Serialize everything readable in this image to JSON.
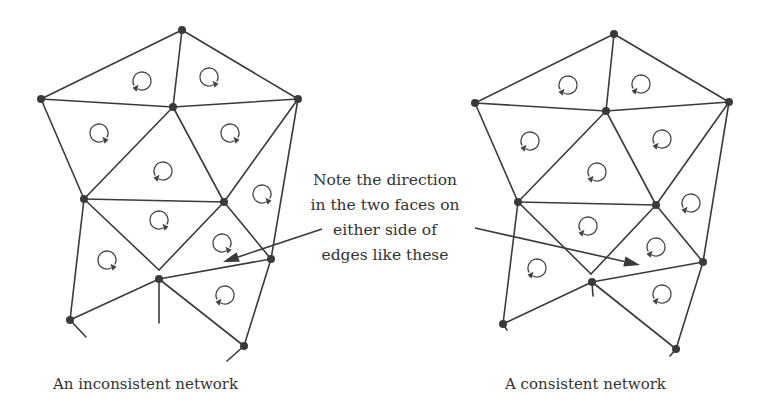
{
  "note": {
    "lines": [
      "Note the direction",
      "in the two faces on",
      "either side of",
      "edges like these"
    ]
  },
  "captions": {
    "left": "An inconsistent network",
    "right": "A consistent network"
  },
  "colors": {
    "ink": "#3a3a3a",
    "text": "#333333",
    "background": "#ffffff"
  },
  "networks": [
    {
      "id": "inconsistent",
      "nodes": [
        [
          182,
          30
        ],
        [
          41,
          99
        ],
        [
          173,
          107
        ],
        [
          298,
          99
        ],
        [
          84,
          199
        ],
        [
          224,
          202
        ],
        [
          271,
          259
        ],
        [
          159,
          279
        ],
        [
          70,
          320
        ],
        [
          244,
          346
        ]
      ],
      "edges": [
        [
          [
            182,
            30
          ],
          [
            41,
            99
          ]
        ],
        [
          [
            182,
            30
          ],
          [
            298,
            99
          ]
        ],
        [
          [
            182,
            30
          ],
          [
            173,
            107
          ]
        ],
        [
          [
            41,
            99
          ],
          [
            173,
            107
          ]
        ],
        [
          [
            173,
            107
          ],
          [
            298,
            99
          ]
        ],
        [
          [
            41,
            99
          ],
          [
            84,
            199
          ]
        ],
        [
          [
            173,
            107
          ],
          [
            84,
            199
          ]
        ],
        [
          [
            173,
            107
          ],
          [
            224,
            202
          ]
        ],
        [
          [
            298,
            99
          ],
          [
            224,
            202
          ]
        ],
        [
          [
            298,
            99
          ],
          [
            271,
            259
          ]
        ],
        [
          [
            84,
            199
          ],
          [
            224,
            202
          ]
        ],
        [
          [
            84,
            199
          ],
          [
            70,
            320
          ]
        ],
        [
          [
            84,
            199
          ],
          [
            159,
            270
          ]
        ],
        [
          [
            224,
            202
          ],
          [
            159,
            270
          ]
        ],
        [
          [
            224,
            202
          ],
          [
            271,
            259
          ]
        ],
        [
          [
            159,
            279
          ],
          [
            271,
            259
          ]
        ],
        [
          [
            70,
            320
          ],
          [
            159,
            279
          ]
        ],
        [
          [
            159,
            279
          ],
          [
            244,
            346
          ]
        ],
        [
          [
            271,
            259
          ],
          [
            244,
            346
          ]
        ],
        [
          [
            159,
            279
          ],
          [
            159,
            323
          ]
        ],
        [
          [
            70,
            320
          ],
          [
            86,
            337
          ]
        ],
        [
          [
            244,
            346
          ],
          [
            227,
            361
          ]
        ]
      ],
      "circulations": [
        {
          "x": 142,
          "y": 81,
          "dir": "cw"
        },
        {
          "x": 209,
          "y": 77,
          "dir": "ccw"
        },
        {
          "x": 99,
          "y": 133,
          "dir": "ccw"
        },
        {
          "x": 230,
          "y": 133,
          "dir": "ccw"
        },
        {
          "x": 163,
          "y": 171,
          "dir": "cw"
        },
        {
          "x": 262,
          "y": 194,
          "dir": "ccw"
        },
        {
          "x": 159,
          "y": 220,
          "dir": "ccw"
        },
        {
          "x": 107,
          "y": 260,
          "dir": "ccw"
        },
        {
          "x": 222,
          "y": 243,
          "dir": "ccw"
        },
        {
          "x": 225,
          "y": 295,
          "dir": "cw"
        }
      ],
      "pointer": {
        "from": [
          322,
          229
        ],
        "to": [
          223,
          262
        ]
      }
    },
    {
      "id": "consistent",
      "nodes": [
        [
          614,
          34
        ],
        [
          475,
          103
        ],
        [
          606,
          111
        ],
        [
          729,
          102
        ],
        [
          518,
          202
        ],
        [
          656,
          205
        ],
        [
          703,
          262
        ],
        [
          592,
          282
        ],
        [
          503,
          324
        ],
        [
          676,
          349
        ]
      ],
      "edges": [
        [
          [
            614,
            34
          ],
          [
            475,
            103
          ]
        ],
        [
          [
            614,
            34
          ],
          [
            729,
            102
          ]
        ],
        [
          [
            614,
            34
          ],
          [
            606,
            111
          ]
        ],
        [
          [
            475,
            103
          ],
          [
            606,
            111
          ]
        ],
        [
          [
            606,
            111
          ],
          [
            729,
            102
          ]
        ],
        [
          [
            475,
            103
          ],
          [
            518,
            202
          ]
        ],
        [
          [
            606,
            111
          ],
          [
            518,
            202
          ]
        ],
        [
          [
            606,
            111
          ],
          [
            656,
            205
          ]
        ],
        [
          [
            729,
            102
          ],
          [
            656,
            205
          ]
        ],
        [
          [
            729,
            102
          ],
          [
            703,
            262
          ]
        ],
        [
          [
            518,
            202
          ],
          [
            656,
            205
          ]
        ],
        [
          [
            518,
            202
          ],
          [
            503,
            324
          ]
        ],
        [
          [
            518,
            202
          ],
          [
            591,
            274
          ]
        ],
        [
          [
            656,
            205
          ],
          [
            591,
            274
          ]
        ],
        [
          [
            656,
            205
          ],
          [
            703,
            262
          ]
        ],
        [
          [
            592,
            282
          ],
          [
            703,
            262
          ]
        ],
        [
          [
            503,
            324
          ],
          [
            592,
            282
          ]
        ],
        [
          [
            592,
            282
          ],
          [
            676,
            349
          ]
        ],
        [
          [
            703,
            262
          ],
          [
            676,
            349
          ]
        ],
        [
          [
            592,
            282
          ],
          [
            593,
            296
          ]
        ],
        [
          [
            503,
            324
          ],
          [
            507,
            330
          ]
        ],
        [
          [
            676,
            349
          ],
          [
            670,
            356
          ]
        ]
      ],
      "circulations": [
        {
          "x": 568,
          "y": 85,
          "dir": "cw"
        },
        {
          "x": 641,
          "y": 84,
          "dir": "cw"
        },
        {
          "x": 530,
          "y": 141,
          "dir": "cw"
        },
        {
          "x": 662,
          "y": 139,
          "dir": "cw"
        },
        {
          "x": 597,
          "y": 172,
          "dir": "cw"
        },
        {
          "x": 691,
          "y": 203,
          "dir": "cw"
        },
        {
          "x": 588,
          "y": 226,
          "dir": "cw"
        },
        {
          "x": 537,
          "y": 268,
          "dir": "cw"
        },
        {
          "x": 656,
          "y": 247,
          "dir": "cw"
        },
        {
          "x": 662,
          "y": 294,
          "dir": "cw"
        }
      ],
      "pointer": {
        "from": [
          475,
          228
        ],
        "to": [
          640,
          265
        ]
      }
    }
  ]
}
